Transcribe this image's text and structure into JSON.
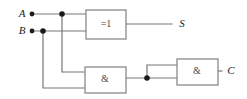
{
  "figure": {
    "name": "half-adder-logic-circuit",
    "width": 247,
    "height": 99,
    "background_color": "#ffffff",
    "wire_color": "#777777",
    "gate_border_color": "#8a8a8a",
    "dot_color": "#1b1b1b",
    "label_color": "#1b1b1b"
  },
  "inputs": [
    {
      "id": "A",
      "label": "A",
      "x": 22,
      "y": 14,
      "dot_x": 32,
      "dot_y": 14
    },
    {
      "id": "B",
      "label": "B",
      "x": 22,
      "y": 31,
      "dot_x": 32,
      "dot_y": 31
    }
  ],
  "outputs": [
    {
      "id": "S",
      "label": "S",
      "x": 182,
      "y": 24
    },
    {
      "id": "C",
      "label": "C",
      "x": 231,
      "y": 71
    }
  ],
  "gates": [
    {
      "id": "xor1",
      "type": "xor",
      "label": "=1",
      "x": 86,
      "y": 10,
      "width": 40,
      "height": 29,
      "label_x": 106,
      "label_y": 25
    },
    {
      "id": "and1",
      "type": "and",
      "label": "&",
      "x": 85,
      "y": 67,
      "width": 41,
      "height": 26,
      "label_x": 105,
      "label_y": 80
    },
    {
      "id": "and2",
      "type": "and",
      "label": "&",
      "x": 177,
      "y": 59,
      "width": 41,
      "height": 26,
      "label_x": 197,
      "label_y": 72
    }
  ],
  "junction_dots": [
    {
      "id": "node-a-branch",
      "x": 62,
      "y": 14
    },
    {
      "id": "node-b-branch",
      "x": 43,
      "y": 31
    },
    {
      "id": "node-carry-branch",
      "x": 147,
      "y": 78
    }
  ],
  "wires": [
    {
      "id": "wire-a-to-xor",
      "d": "M 32 14 L 86 14"
    },
    {
      "id": "wire-b-to-xor",
      "d": "M 32 31 L 86 31"
    },
    {
      "id": "wire-a-branch-down",
      "d": "M 62 14 L 62 72 L 85 72"
    },
    {
      "id": "wire-b-branch-down",
      "d": "M 43 31 L 43 88 L 85 88"
    },
    {
      "id": "wire-xor-out-to-s",
      "d": "M 126 24 L 172 24"
    },
    {
      "id": "wire-and1-out",
      "d": "M 126 78 L 177 78"
    },
    {
      "id": "wire-carry-up-to-and2",
      "d": "M 147 78 L 147 65 L 177 65"
    },
    {
      "id": "wire-and2-out-to-c",
      "d": "M 218 71 L 222 71"
    }
  ]
}
